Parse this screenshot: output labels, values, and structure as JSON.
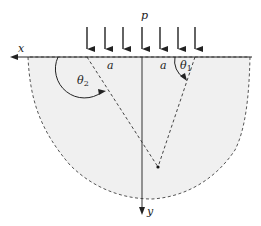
{
  "diagram": {
    "type": "strip-load stress diagram",
    "labels": {
      "load": "p",
      "x_axis": "x",
      "y_axis": "y",
      "half_width_left": "a",
      "half_width_right": "a",
      "theta2": "θ",
      "theta2_sub": "2",
      "theta1": "θ",
      "theta1_sub": "1"
    },
    "load_arrows": 7,
    "colors": {
      "line": "#222222",
      "dashed": "#444444",
      "fill": "#f0f0f0"
    }
  }
}
